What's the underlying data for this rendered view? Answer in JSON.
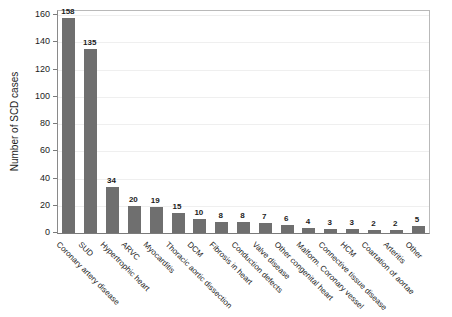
{
  "chart_data": {
    "type": "bar",
    "title": "",
    "xlabel": "",
    "ylabel": "Number of SCD cases",
    "ylim": [
      0,
      160
    ],
    "yticks": [
      0,
      20,
      40,
      60,
      80,
      100,
      120,
      140,
      160
    ],
    "grid": "faint-horizontal",
    "legend": "none",
    "bar_color": "#6f6f6f",
    "categories": [
      "Coronary artery disease",
      "SUD",
      "Hypertrophic heart",
      "ARVC",
      "Myocarditis",
      "Thoracic aortic dissection",
      "DCM",
      "Fibrosis in heart",
      "Conduction defects",
      "Valve disease",
      "Other congenital heart",
      "Malform. Coronary vessel",
      "Connective tissue disease",
      "HCM",
      "Coartation of aortae",
      "Arteritis",
      "Other"
    ],
    "values": [
      158,
      135,
      34,
      20,
      19,
      15,
      10,
      8,
      8,
      7,
      6,
      4,
      3,
      3,
      2,
      2,
      5
    ]
  },
  "colors": {
    "background": "#ffffff",
    "bar": "#6f6f6f",
    "axis": "#7a7a7a",
    "box_border": "#b9b9b9",
    "gridline": "#efefef",
    "text": "#1c1c1c"
  }
}
